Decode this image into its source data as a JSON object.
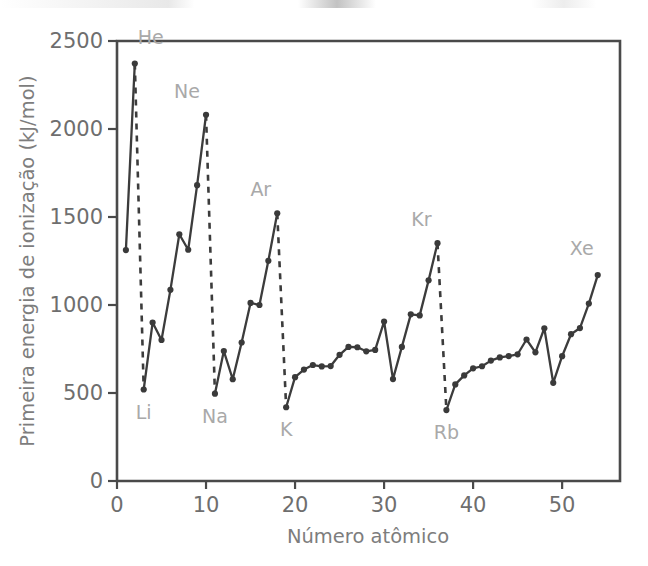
{
  "chart_data": {
    "type": "line",
    "title": "",
    "xlabel": "Número atômico",
    "ylabel": "Primeira energia de ionização (kJ/mol)",
    "xlim": [
      0,
      56.5
    ],
    "ylim": [
      0,
      2500
    ],
    "xticks": [
      0,
      10,
      20,
      30,
      40,
      50
    ],
    "xtick_labels": [
      "0",
      "10",
      "20",
      "30",
      "40",
      "50"
    ],
    "yticks": [
      0,
      500,
      1000,
      1500,
      2000,
      2500
    ],
    "ytick_labels": [
      "0",
      "500",
      "1000",
      "1500",
      "2000",
      "2500"
    ],
    "grid": false,
    "legend": false,
    "line_color": "#3c3c3c",
    "marker_color": "#3a3a3a",
    "annotation_color": "#a9a9a9",
    "axis_color": "#4a4a4a",
    "series": [
      {
        "name": "Primeira energia de ionização",
        "x": [
          1,
          2,
          3,
          4,
          5,
          6,
          7,
          8,
          9,
          10,
          11,
          12,
          13,
          14,
          15,
          16,
          17,
          18,
          19,
          20,
          21,
          22,
          23,
          24,
          25,
          26,
          27,
          28,
          29,
          30,
          31,
          32,
          33,
          34,
          35,
          36,
          37,
          38,
          39,
          40,
          41,
          42,
          43,
          44,
          45,
          46,
          47,
          48,
          49,
          50,
          51,
          52,
          53,
          54
        ],
        "values": [
          1312,
          2372,
          520,
          900,
          801,
          1086,
          1402,
          1314,
          1681,
          2081,
          496,
          738,
          578,
          787,
          1012,
          1000,
          1251,
          1521,
          419,
          590,
          633,
          659,
          651,
          653,
          717,
          762,
          760,
          737,
          745,
          906,
          579,
          762,
          947,
          941,
          1140,
          1351,
          403,
          549,
          600,
          640,
          652,
          684,
          702,
          710,
          720,
          804,
          731,
          868,
          558,
          709,
          834,
          869,
          1008,
          1170
        ]
      }
    ],
    "dashed_connections": [
      {
        "from_z": 2,
        "to_z": 3,
        "from_label": "He",
        "to_label": "Li"
      },
      {
        "from_z": 10,
        "to_z": 11,
        "from_label": "Ne",
        "to_label": "Na"
      },
      {
        "from_z": 18,
        "to_z": 19,
        "from_label": "Ar",
        "to_label": "K"
      },
      {
        "from_z": 36,
        "to_z": 37,
        "from_label": "Kr",
        "to_label": "Rb"
      }
    ],
    "annotations": [
      {
        "text": "He",
        "z": 2,
        "value": 2372,
        "position": "above-left"
      },
      {
        "text": "Ne",
        "z": 10,
        "value": 2081,
        "position": "above-left"
      },
      {
        "text": "Ar",
        "z": 18,
        "value": 1521,
        "position": "above-left"
      },
      {
        "text": "Kr",
        "z": 36,
        "value": 1351,
        "position": "above-left"
      },
      {
        "text": "Xe",
        "z": 54,
        "value": 1170,
        "position": "above-left"
      },
      {
        "text": "Li",
        "z": 3,
        "value": 520,
        "position": "below"
      },
      {
        "text": "Na",
        "z": 11,
        "value": 496,
        "position": "below"
      },
      {
        "text": "K",
        "z": 19,
        "value": 419,
        "position": "below"
      },
      {
        "text": "Rb",
        "z": 37,
        "value": 403,
        "position": "below"
      }
    ]
  }
}
